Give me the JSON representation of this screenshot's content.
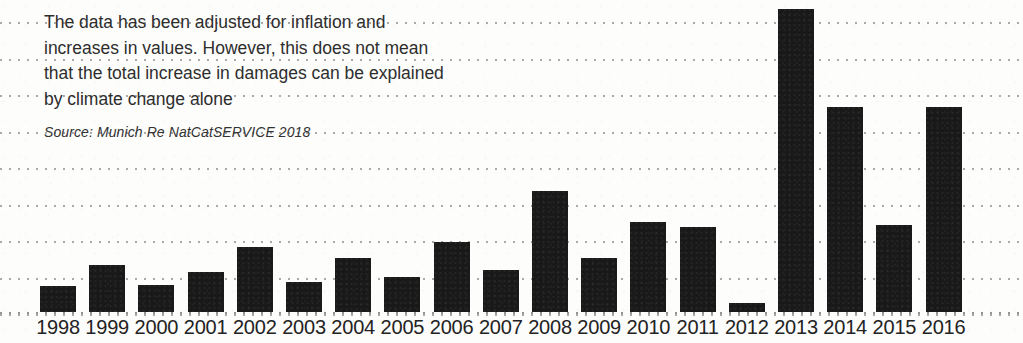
{
  "annotation": {
    "lines": [
      "The data has been adjusted for inflation and",
      "increases in values. However, this does not mean",
      "that the total increase in damages can be explained",
      "by climate change alone"
    ],
    "source": "Source: Munich Re NatCatSERVICE 2018"
  },
  "colors": {
    "bar": "#191919",
    "gridline": "#9a9a98",
    "text": "#2e2e2e",
    "axis_text": "#232323",
    "background": "#fdfdfc"
  },
  "chart_data": {
    "type": "bar",
    "title": "",
    "subtitle": "",
    "xlabel": "",
    "ylabel": "",
    "grid": true,
    "gridlines": 9,
    "legend": "none",
    "note": "The data has been adjusted for inflation and increases in values. However, this does not mean that the total increase in damages can be explained by climate change alone",
    "source": "Source: Munich Re NatCatSERVICE 2018",
    "categories": [
      "1998",
      "1999",
      "2000",
      "2001",
      "2002",
      "2003",
      "2004",
      "2005",
      "2006",
      "2007",
      "2008",
      "2009",
      "2010",
      "2011",
      "2012",
      "2013",
      "2014",
      "2015",
      "2016"
    ],
    "values": [
      0.3,
      0.54,
      0.31,
      0.46,
      0.75,
      0.34,
      0.62,
      0.4,
      0.81,
      0.48,
      1.39,
      0.62,
      1.04,
      0.98,
      0.1,
      3.48,
      2.36,
      1.0,
      2.36
    ],
    "ylim": [
      0,
      3.55
    ],
    "yticks": [],
    "bar_tops_px": [
      286,
      265,
      285,
      272,
      247,
      282,
      258,
      277,
      242,
      270,
      191,
      258,
      222,
      227,
      303,
      9,
      107,
      225,
      107
    ],
    "baseline_px": 312
  },
  "layout": {
    "plot_left_px": 40,
    "bar_pitch_px": 49.2,
    "bar_width_px": 36,
    "gridline_spacing_px": 36.5,
    "gridline_top_px": 22
  }
}
